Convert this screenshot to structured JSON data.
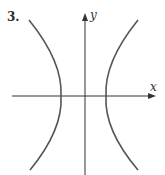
{
  "figure": {
    "number_label": "3.",
    "x_axis_label": "x",
    "y_axis_label": "y",
    "curve": "hyperbola opening left and right",
    "colors": {
      "axis": "#333333",
      "curve": "#555555"
    }
  }
}
